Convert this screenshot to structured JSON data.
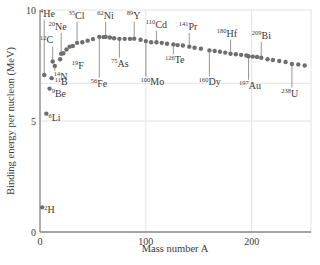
{
  "chart_data": {
    "type": "scatter",
    "title": "",
    "xlabel": "Mass number A",
    "ylabel": "Binding energy per nucleon (MeV)",
    "xlim": [
      0,
      256
    ],
    "ylim": [
      0,
      10
    ],
    "xticks": [
      0,
      100,
      200
    ],
    "yticks": [
      0,
      5,
      10
    ],
    "grid": {
      "x": [
        100,
        200
      ],
      "y": [
        5,
        6.7
      ]
    },
    "colors": {
      "points": "#6e6e6e",
      "axes": "#8a8a8a",
      "grid": "#e2e2e2",
      "text": "#3a3a3a",
      "leader": "#7a7a7a"
    },
    "series": [
      {
        "name": "Binding energy per nucleon",
        "points": [
          [
            2,
            1.11
          ],
          [
            4,
            7.07
          ],
          [
            6,
            5.33
          ],
          [
            9,
            6.46
          ],
          [
            11,
            6.93
          ],
          [
            12,
            7.68
          ],
          [
            14,
            7.48
          ],
          [
            19,
            7.78
          ],
          [
            20,
            8.03
          ],
          [
            22,
            8.05
          ],
          [
            25,
            8.22
          ],
          [
            28,
            8.35
          ],
          [
            31,
            8.38
          ],
          [
            35,
            8.52
          ],
          [
            40,
            8.55
          ],
          [
            45,
            8.62
          ],
          [
            50,
            8.69
          ],
          [
            56,
            8.79
          ],
          [
            60,
            8.78
          ],
          [
            62,
            8.79
          ],
          [
            66,
            8.76
          ],
          [
            70,
            8.73
          ],
          [
            75,
            8.7
          ],
          [
            80,
            8.7
          ],
          [
            85,
            8.7
          ],
          [
            89,
            8.71
          ],
          [
            95,
            8.66
          ],
          [
            100,
            8.6
          ],
          [
            105,
            8.55
          ],
          [
            110,
            8.55
          ],
          [
            115,
            8.52
          ],
          [
            120,
            8.48
          ],
          [
            126,
            8.45
          ],
          [
            130,
            8.42
          ],
          [
            135,
            8.4
          ],
          [
            141,
            8.35
          ],
          [
            146,
            8.3
          ],
          [
            152,
            8.26
          ],
          [
            160,
            8.18
          ],
          [
            165,
            8.15
          ],
          [
            170,
            8.12
          ],
          [
            175,
            8.08
          ],
          [
            180,
            8.03
          ],
          [
            185,
            8.01
          ],
          [
            190,
            7.98
          ],
          [
            195,
            7.95
          ],
          [
            197,
            7.92
          ],
          [
            201,
            7.9
          ],
          [
            205,
            7.88
          ],
          [
            209,
            7.85
          ],
          [
            215,
            7.78
          ],
          [
            220,
            7.75
          ],
          [
            226,
            7.7
          ],
          [
            232,
            7.66
          ],
          [
            238,
            7.57
          ],
          [
            244,
            7.55
          ],
          [
            250,
            7.5
          ]
        ]
      }
    ],
    "annotations": [
      {
        "mass": "4",
        "sym": "He",
        "x": 4,
        "y": 7.07,
        "lx": 0,
        "ly": 9.7,
        "side": "above"
      },
      {
        "mass": "20",
        "sym": "Ne",
        "x": 20,
        "y": 8.03,
        "lx": 8,
        "ly": 9.1,
        "side": "above"
      },
      {
        "mass": "12",
        "sym": "C",
        "x": 12,
        "y": 7.68,
        "lx": 0,
        "ly": 8.5,
        "side": "above"
      },
      {
        "mass": "35",
        "sym": "Cl",
        "x": 35,
        "y": 8.52,
        "lx": 27,
        "ly": 9.6,
        "side": "above"
      },
      {
        "mass": "62",
        "sym": "Ni",
        "x": 62,
        "y": 8.79,
        "lx": 54,
        "ly": 9.6,
        "side": "above"
      },
      {
        "mass": "89",
        "sym": "Y",
        "x": 89,
        "y": 8.71,
        "lx": 82,
        "ly": 9.6,
        "side": "above"
      },
      {
        "mass": "110",
        "sym": "Cd",
        "x": 110,
        "y": 8.55,
        "lx": 100,
        "ly": 9.2,
        "side": "above"
      },
      {
        "mass": "141",
        "sym": "Pr",
        "x": 141,
        "y": 8.35,
        "lx": 131,
        "ly": 9.1,
        "side": "above"
      },
      {
        "mass": "180",
        "sym": "Hf",
        "x": 180,
        "y": 8.03,
        "lx": 167,
        "ly": 8.8,
        "side": "above"
      },
      {
        "mass": "209",
        "sym": "Bi",
        "x": 209,
        "y": 7.85,
        "lx": 200,
        "ly": 8.7,
        "side": "above"
      },
      {
        "mass": "14",
        "sym": "N",
        "x": 14,
        "y": 7.48,
        "lx": 13,
        "ly": 6.85,
        "side": "below"
      },
      {
        "mass": "11",
        "sym": "B",
        "x": 11,
        "y": 6.93,
        "lx": 14,
        "ly": 6.6,
        "side": "right"
      },
      {
        "mass": "19",
        "sym": "F",
        "x": 19,
        "y": 7.78,
        "lx": 30,
        "ly": 7.35,
        "side": "below"
      },
      {
        "mass": "9",
        "sym": "Be",
        "x": 9,
        "y": 6.46,
        "lx": 11,
        "ly": 6.1,
        "side": "right"
      },
      {
        "mass": "6",
        "sym": "Li",
        "x": 6,
        "y": 5.33,
        "lx": 8,
        "ly": 5.0,
        "side": "right"
      },
      {
        "mass": "2",
        "sym": "H",
        "x": 2,
        "y": 1.11,
        "lx": 4,
        "ly": 0.85,
        "side": "right"
      },
      {
        "mass": "56",
        "sym": "Fe",
        "x": 56,
        "y": 8.79,
        "lx": 48,
        "ly": 6.55,
        "side": "below"
      },
      {
        "mass": "75",
        "sym": "As",
        "x": 75,
        "y": 8.7,
        "lx": 67,
        "ly": 7.45,
        "side": "below"
      },
      {
        "mass": "100",
        "sym": "Mo",
        "x": 100,
        "y": 8.6,
        "lx": 95,
        "ly": 6.6,
        "side": "below"
      },
      {
        "mass": "126",
        "sym": "Te",
        "x": 126,
        "y": 8.45,
        "lx": 118,
        "ly": 7.6,
        "side": "below"
      },
      {
        "mass": "160",
        "sym": "Dy",
        "x": 160,
        "y": 8.18,
        "lx": 150,
        "ly": 6.6,
        "side": "below"
      },
      {
        "mass": "197",
        "sym": "Au",
        "x": 197,
        "y": 7.92,
        "lx": 188,
        "ly": 6.45,
        "side": "below"
      },
      {
        "mass": "238",
        "sym": "U",
        "x": 238,
        "y": 7.57,
        "lx": 228,
        "ly": 6.1,
        "side": "below"
      }
    ]
  }
}
